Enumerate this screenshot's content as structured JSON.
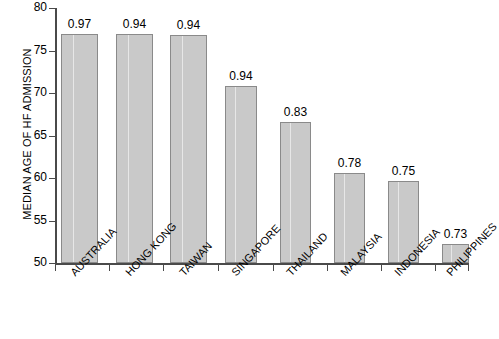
{
  "chart_data": {
    "type": "bar",
    "title": "",
    "xlabel": "",
    "ylabel": "MEDIAN AGE OF HF ADMISSION",
    "ylim": [
      50,
      80
    ],
    "yticks": [
      50,
      55,
      60,
      65,
      70,
      75,
      80
    ],
    "grid": false,
    "legend": "none",
    "bar_color": "#c9c9c9",
    "bar_edge_color": "#8a8a8a",
    "categories": [
      "AUSTRALIA",
      "HONG KONG",
      "TAIWAN",
      "SINGAPORE",
      "THAILAND",
      "MALAYSIA",
      "INDONESIA",
      "PHILIPPINES"
    ],
    "values": [
      76.9,
      76.9,
      76.8,
      70.8,
      66.6,
      60.6,
      59.6,
      52.2
    ],
    "bar_labels": [
      "0.97",
      "0.94",
      "0.94",
      "0.94",
      "0.83",
      "0.78",
      "0.75",
      "0.73"
    ]
  }
}
